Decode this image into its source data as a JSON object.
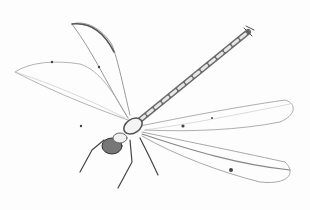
{
  "image": {
    "subject": "Pencil sketch of a dragonfly",
    "description": "Grayscale pencil drawing of a dragonfly with four veined translucent wings and a long segmented abdomen extending to the upper right",
    "colors": {
      "background": "#fdfdfd",
      "stroke_dark": "#3a3a3a",
      "stroke_mid": "#7a7a7a",
      "stroke_light": "#b8b8b8"
    }
  }
}
